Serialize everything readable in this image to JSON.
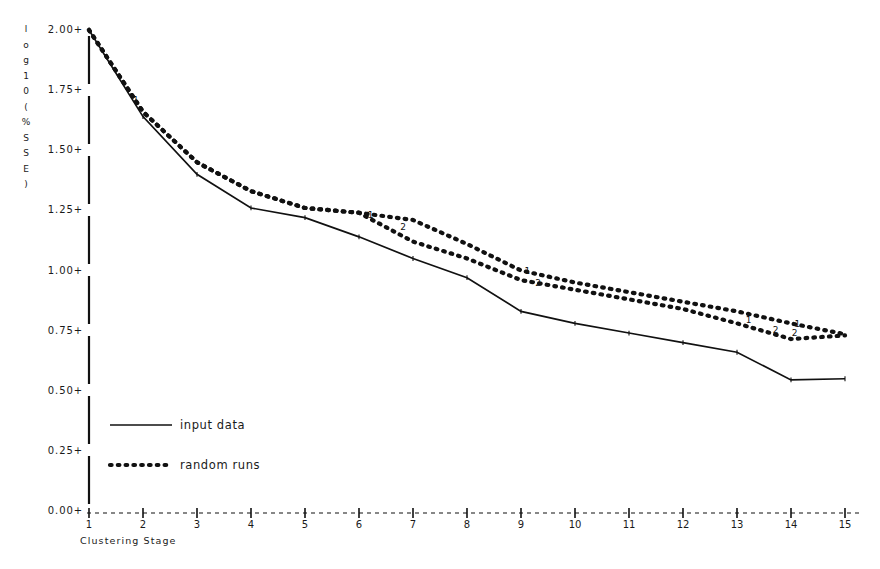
{
  "chart_data": {
    "type": "line",
    "title": "",
    "xlabel": "Clustering Stage",
    "ylabel": "log10(%SSE)",
    "ylabel_chars": [
      "l",
      "o",
      "g",
      "1",
      "0",
      "(",
      "%",
      "S",
      "S",
      "E",
      ")"
    ],
    "xlim": [
      1,
      15
    ],
    "ylim": [
      0.0,
      2.0
    ],
    "grid": false,
    "legend_position": "lower-left",
    "x_ticks": [
      1,
      2,
      3,
      4,
      5,
      6,
      7,
      8,
      9,
      10,
      11,
      12,
      13,
      14,
      15
    ],
    "x_tick_labels": [
      "1",
      "2",
      "3",
      "4",
      "5",
      "6",
      "7",
      "8",
      "9",
      "10",
      "11",
      "12",
      "13",
      "14",
      "15"
    ],
    "y_ticks": [
      0.0,
      0.25,
      0.5,
      0.75,
      1.0,
      1.25,
      1.5,
      1.75,
      2.0
    ],
    "y_tick_labels": [
      "0.00+",
      "0.25+",
      "0.50+",
      "0.75+",
      "1.00+",
      "1.25+",
      "1.50+",
      "1.75+",
      "2.00+"
    ],
    "categories": [
      1,
      2,
      3,
      4,
      5,
      6,
      7,
      8,
      9,
      10,
      11,
      12,
      13,
      14,
      15
    ],
    "series": [
      {
        "name": "input data",
        "style": "solid",
        "marker_label": "",
        "values": [
          2.0,
          1.64,
          1.4,
          1.26,
          1.22,
          1.14,
          1.05,
          0.97,
          0.83,
          0.78,
          0.74,
          0.7,
          0.66,
          0.545,
          0.55
        ]
      },
      {
        "name": "random runs 1",
        "style": "dotted",
        "marker_label": "1",
        "values": [
          2.0,
          1.66,
          1.45,
          1.33,
          1.26,
          1.24,
          1.21,
          1.11,
          1.0,
          0.95,
          0.91,
          0.87,
          0.83,
          0.78,
          0.735
        ]
      },
      {
        "name": "random runs 2",
        "style": "dotted",
        "marker_label": "2",
        "values": [
          2.0,
          1.66,
          1.45,
          1.33,
          1.26,
          1.24,
          1.12,
          1.05,
          0.96,
          0.92,
          0.88,
          0.84,
          0.78,
          0.715,
          0.73
        ]
      }
    ],
    "legend": [
      {
        "label": "input data",
        "style": "solid"
      },
      {
        "label": "random runs",
        "style": "dotted"
      }
    ],
    "inline_series_labels": [
      {
        "text": "1",
        "x": 1.85,
        "y": 1.705
      },
      {
        "text": "1",
        "x": 6.2,
        "y": 1.228
      },
      {
        "text": "2",
        "x": 6.8,
        "y": 1.175
      },
      {
        "text": "1",
        "x": 9.1,
        "y": 0.995
      },
      {
        "text": "2",
        "x": 9.3,
        "y": 0.945
      },
      {
        "text": "1",
        "x": 13.2,
        "y": 0.79
      },
      {
        "text": "2",
        "x": 13.7,
        "y": 0.748
      },
      {
        "text": "1",
        "x": 14.1,
        "y": 0.775
      },
      {
        "text": "2",
        "x": 14.05,
        "y": 0.735
      }
    ]
  }
}
